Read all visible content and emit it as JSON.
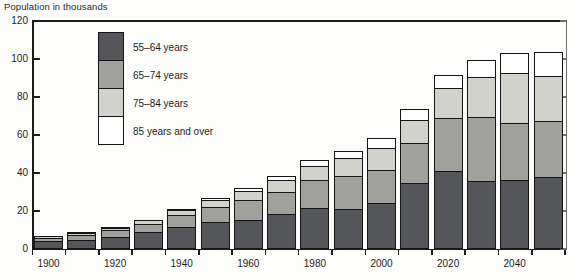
{
  "axis_title": "Population in thousands",
  "legend": {
    "entries": [
      {
        "label": "55–64 years",
        "color": "#55565a"
      },
      {
        "label": "65–74 years",
        "color": "#a0a09c"
      },
      {
        "label": "75–84 years",
        "color": "#d2d2cd"
      },
      {
        "label": "85 years and over",
        "color": "#ffffff"
      }
    ]
  },
  "chart_data": {
    "type": "bar",
    "subtype": "stacked-vertical",
    "title": "",
    "subtitle": "",
    "xlabel": "",
    "ylabel": "Population in thousands",
    "ylim": [
      0,
      120
    ],
    "ytick_values": [
      0,
      20,
      40,
      60,
      80,
      100,
      120
    ],
    "ytick_labels": [
      "0",
      "20",
      "40",
      "60",
      "80",
      "100",
      "120"
    ],
    "grid": false,
    "legend_position": "upper-left-inside",
    "categories": [
      "1900",
      "1910",
      "1920",
      "1930",
      "1940",
      "1950",
      "1960",
      "1970",
      "1980",
      "1990",
      "2000",
      "2010",
      "2020",
      "2030",
      "2040",
      "2050"
    ],
    "xtick_labels": [
      "1900",
      "1920",
      "1940",
      "1960",
      "1980",
      "2000",
      "2020",
      "2040"
    ],
    "xtick_categories": [
      "1900",
      "1920",
      "1940",
      "1960",
      "1980",
      "2000",
      "2020",
      "2040"
    ],
    "series": [
      {
        "name": "55–64 years",
        "color": "#55565a",
        "values": [
          4.0,
          5.0,
          6.5,
          9.0,
          11.5,
          14.0,
          15.5,
          18.5,
          21.5,
          21.0,
          24.0,
          35.0,
          41.0,
          36.0,
          36.5,
          38.0
        ]
      },
      {
        "name": "65–74 years",
        "color": "#a0a09c",
        "values": [
          2.3,
          3.0,
          3.8,
          4.8,
          7.0,
          8.5,
          10.5,
          12.0,
          15.5,
          18.0,
          18.0,
          21.0,
          28.5,
          34.0,
          30.5,
          30.0
        ]
      },
      {
        "name": "75–84 years",
        "color": "#d2d2cd",
        "values": [
          1.2,
          1.5,
          1.8,
          2.2,
          3.0,
          4.0,
          5.5,
          6.5,
          7.5,
          10.0,
          12.0,
          13.0,
          16.0,
          21.5,
          26.5,
          24.0
        ]
      },
      {
        "name": "85 years and over",
        "color": "#ffffff",
        "values": [
          0.4,
          0.5,
          0.6,
          0.8,
          1.0,
          1.5,
          2.0,
          2.5,
          3.5,
          4.0,
          5.5,
          6.0,
          7.5,
          9.5,
          11.0,
          13.0
        ]
      }
    ],
    "totals": [
      7.9,
      10.0,
      12.7,
      16.8,
      22.5,
      28.0,
      33.5,
      39.5,
      48.0,
      53.0,
      59.5,
      75.0,
      93.0,
      101.0,
      104.5,
      105.0
    ]
  },
  "geometry": {
    "plot_left": 33,
    "plot_right": 566,
    "plot_top": 21,
    "plot_bottom": 249,
    "bar_width": 29,
    "bar_pitch": 33.3,
    "bar_start": 34
  }
}
